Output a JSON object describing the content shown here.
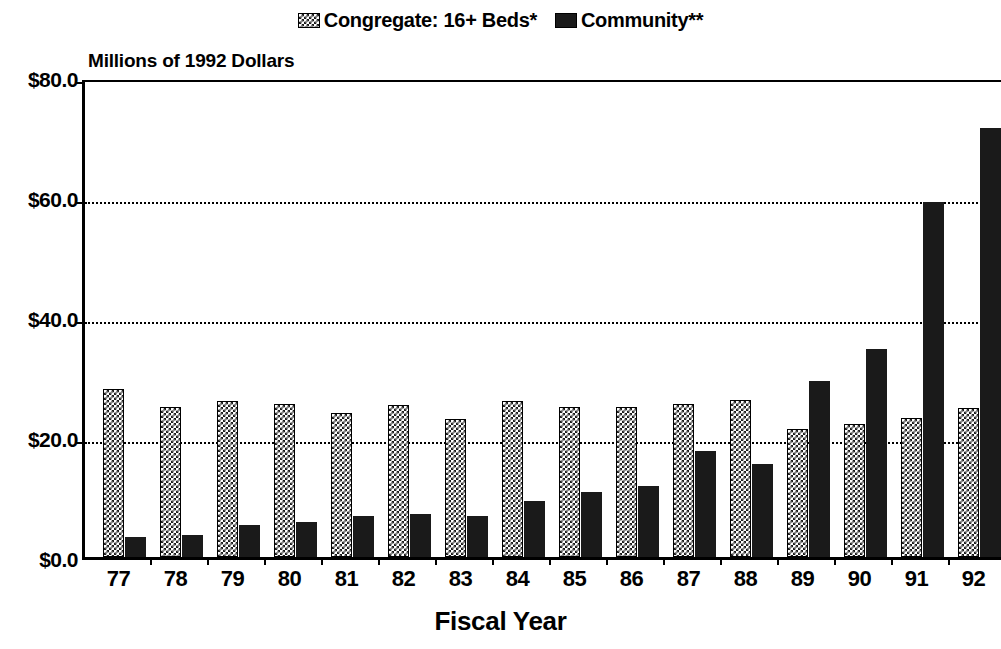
{
  "legend": {
    "position": "top-center",
    "entries": [
      {
        "label": "Congregate: 16+ Beds*",
        "swatch": "checker-pattern-swatch",
        "color": "#1a1a1a"
      },
      {
        "label": "Community**",
        "swatch": "solid-black-swatch",
        "color": "#1a1a1a"
      }
    ]
  },
  "axes": {
    "y_title": "Millions of 1992 Dollars",
    "x_title": "Fiscal Year"
  },
  "chart_data": {
    "type": "bar",
    "title": "",
    "subtitle": "",
    "xlabel": "Fiscal Year",
    "ylabel": "Millions of 1992 Dollars",
    "ylim": [
      0,
      80
    ],
    "yticks": [
      0,
      20,
      40,
      60,
      80
    ],
    "ytick_labels": [
      "$0.0",
      "$20.0",
      "$40.0",
      "$60.0",
      "$80.0"
    ],
    "grid": true,
    "grid_axis": "y",
    "grid_style": "dotted",
    "legend_position": "top-center",
    "categories": [
      "77",
      "78",
      "79",
      "80",
      "81",
      "82",
      "83",
      "84",
      "85",
      "86",
      "87",
      "88",
      "89",
      "90",
      "91",
      "92"
    ],
    "series": [
      {
        "name": "Congregate: 16+ Beds*",
        "pattern": "checker",
        "color": "#1a1a1a",
        "values": [
          28.0,
          25.0,
          26.0,
          25.5,
          24.0,
          25.4,
          23.0,
          26.0,
          25.0,
          25.0,
          25.5,
          26.2,
          21.4,
          22.1,
          23.2,
          24.8
        ]
      },
      {
        "name": "Community**",
        "pattern": "solid",
        "color": "#1a1a1a",
        "values": [
          3.4,
          3.6,
          5.3,
          5.8,
          6.9,
          7.2,
          6.8,
          9.3,
          10.9,
          11.8,
          17.6,
          15.5,
          29.3,
          34.6,
          59.2,
          71.5
        ]
      }
    ],
    "annotations": []
  }
}
